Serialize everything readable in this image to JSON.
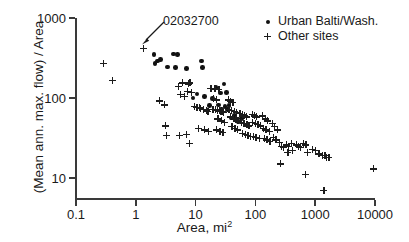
{
  "chart_data": {
    "type": "scatter",
    "title": "",
    "xlabel": "Area, mi2",
    "xlabel_base": "Area, mi",
    "xlabel_sup": "2",
    "ylabel": "(Mean ann. max. flow) / Area",
    "xscale": "log",
    "yscale": "log",
    "xlim": [
      0.1,
      10000
    ],
    "ylim": [
      5,
      1000
    ],
    "xticks": [
      "0.1",
      "1",
      "10",
      "100",
      "1000",
      "10000"
    ],
    "xtick_values": [
      0.1,
      1,
      10,
      100,
      1000,
      10000
    ],
    "yticks": [
      "1000",
      "100",
      "10"
    ],
    "ytick_values": [
      1000,
      100,
      10
    ],
    "grid": false,
    "legend_position": "top-right",
    "annotations": [
      {
        "text": "02032700",
        "points_to_x": 1.35,
        "points_to_y": 420,
        "series": "Other sites"
      }
    ],
    "series": [
      {
        "name": "Urban Balti/Wash.",
        "marker": "filled-circle",
        "color": "#111111",
        "points": [
          [
            2.0,
            350
          ],
          [
            2.3,
            290
          ],
          [
            2.1,
            270
          ],
          [
            2.6,
            305
          ],
          [
            3.4,
            245
          ],
          [
            4.3,
            355
          ],
          [
            5.0,
            352
          ],
          [
            4.6,
            240
          ],
          [
            7.0,
            235
          ],
          [
            12.5,
            290
          ],
          [
            13.0,
            240
          ],
          [
            22.0,
            135
          ],
          [
            26.0,
            115
          ],
          [
            30.0,
            150
          ],
          [
            33.0,
            118
          ],
          [
            19.0,
            98
          ],
          [
            24.0,
            82
          ],
          [
            31.0,
            78
          ],
          [
            36.0,
            80
          ],
          [
            27.0,
            73
          ],
          [
            34.0,
            72
          ],
          [
            40.0,
            56
          ],
          [
            45.0,
            60
          ],
          [
            52.0,
            50
          ],
          [
            58.0,
            55
          ],
          [
            62.0,
            58
          ],
          [
            17.0,
            80
          ],
          [
            14.0,
            105
          ],
          [
            10.5,
            112
          ],
          [
            9.0,
            100
          ]
        ]
      },
      {
        "name": "Other sites",
        "marker": "plus",
        "color": "#1c1c1c",
        "points": [
          [
            0.29,
            270
          ],
          [
            0.4,
            165
          ],
          [
            1.35,
            420
          ],
          [
            2.5,
            92
          ],
          [
            3.0,
            82
          ],
          [
            3.1,
            45
          ],
          [
            3.2,
            34
          ],
          [
            5.2,
            140
          ],
          [
            6.0,
            155
          ],
          [
            5.6,
            112
          ],
          [
            6.4,
            105
          ],
          [
            7.5,
            150
          ],
          [
            8.0,
            155
          ],
          [
            7.2,
            120
          ],
          [
            8.6,
            118
          ],
          [
            7.0,
            35
          ],
          [
            7.8,
            27
          ],
          [
            5.4,
            34
          ],
          [
            9.5,
            78
          ],
          [
            10.5,
            76
          ],
          [
            11.5,
            77
          ],
          [
            12.0,
            74
          ],
          [
            13.5,
            72
          ],
          [
            15.0,
            70
          ],
          [
            16.0,
            68
          ],
          [
            14.0,
            40
          ],
          [
            16.5,
            38
          ],
          [
            11.0,
            42
          ],
          [
            18.0,
            133
          ],
          [
            21.0,
            130
          ],
          [
            24.5,
            128
          ],
          [
            20.0,
            100
          ],
          [
            22.5,
            95
          ],
          [
            19.5,
            72
          ],
          [
            21.5,
            71
          ],
          [
            23.0,
            70
          ],
          [
            25.0,
            69
          ],
          [
            26.5,
            68
          ],
          [
            28.0,
            67
          ],
          [
            29.5,
            66
          ],
          [
            23.5,
            55
          ],
          [
            27.0,
            52
          ],
          [
            30.0,
            50
          ],
          [
            22.0,
            40
          ],
          [
            25.5,
            38
          ],
          [
            28.5,
            37
          ],
          [
            35.0,
            95
          ],
          [
            38.0,
            90
          ],
          [
            42.0,
            88
          ],
          [
            36.0,
            72
          ],
          [
            40.0,
            70
          ],
          [
            44.0,
            68
          ],
          [
            48.0,
            66
          ],
          [
            38.5,
            58
          ],
          [
            43.0,
            56
          ],
          [
            47.0,
            54
          ],
          [
            51.0,
            52
          ],
          [
            40.5,
            44
          ],
          [
            45.5,
            42
          ],
          [
            50.0,
            40
          ],
          [
            55.0,
            64
          ],
          [
            60.0,
            62
          ],
          [
            65.0,
            60
          ],
          [
            70.0,
            58
          ],
          [
            58.0,
            50
          ],
          [
            64.0,
            48
          ],
          [
            72.0,
            46
          ],
          [
            78.0,
            45
          ],
          [
            60.5,
            36
          ],
          [
            68.0,
            35
          ],
          [
            75.0,
            34
          ],
          [
            82.0,
            33
          ],
          [
            88.0,
            62
          ],
          [
            95.0,
            60
          ],
          [
            105.0,
            58
          ],
          [
            90.0,
            50
          ],
          [
            100.0,
            48
          ],
          [
            110.0,
            47
          ],
          [
            120.0,
            45
          ],
          [
            92.0,
            33
          ],
          [
            102.0,
            32
          ],
          [
            115.0,
            31
          ],
          [
            130.0,
            60
          ],
          [
            145.0,
            55
          ],
          [
            160.0,
            52
          ],
          [
            135.0,
            42
          ],
          [
            150.0,
            40
          ],
          [
            170.0,
            38
          ],
          [
            140.0,
            31
          ],
          [
            155.0,
            30
          ],
          [
            175.0,
            29
          ],
          [
            190.0,
            48
          ],
          [
            210.0,
            44
          ],
          [
            230.0,
            40
          ],
          [
            200.0,
            32
          ],
          [
            220.0,
            30
          ],
          [
            250.0,
            28
          ],
          [
            270.0,
            25
          ],
          [
            290.0,
            24
          ],
          [
            260.0,
            15
          ],
          [
            330.0,
            26
          ],
          [
            360.0,
            25
          ],
          [
            400.0,
            27
          ],
          [
            350.0,
            21
          ],
          [
            420.0,
            22
          ],
          [
            480.0,
            26
          ],
          [
            520.0,
            25
          ],
          [
            560.0,
            24
          ],
          [
            640.0,
            27
          ],
          [
            700.0,
            26
          ],
          [
            730.0,
            21
          ],
          [
            690.0,
            11
          ],
          [
            900.0,
            23
          ],
          [
            1000.0,
            22
          ],
          [
            1150.0,
            20
          ],
          [
            1300.0,
            19
          ],
          [
            1450.0,
            19
          ],
          [
            1550.0,
            18
          ],
          [
            1700.0,
            18
          ],
          [
            1400.0,
            7
          ],
          [
            9500.0,
            13
          ]
        ]
      }
    ]
  },
  "legend": {
    "items": [
      {
        "label": "Urban Balti/Wash.",
        "marker": "filled-circle"
      },
      {
        "label": "Other sites",
        "marker": "plus"
      }
    ]
  },
  "annotation": {
    "label": "02032700"
  },
  "axes": {
    "y_title": "(Mean ann. max. flow) / Area",
    "x_title_base": "Area, mi",
    "x_title_sup": "2"
  }
}
